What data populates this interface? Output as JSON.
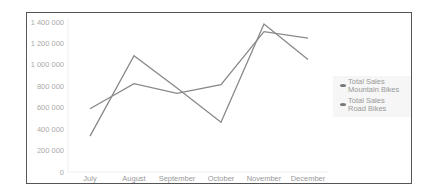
{
  "chart_data": {
    "type": "line",
    "title": "",
    "xlabel": "",
    "ylabel": "",
    "categories": [
      "July",
      "August",
      "September",
      "October",
      "November",
      "December"
    ],
    "series": [
      {
        "name": "Total Sales Mountain Bikes",
        "values": [
          335000,
          1085000,
          785000,
          465000,
          1380000,
          1050000
        ],
        "color": "#888888"
      },
      {
        "name": "Total Sales Road Bikes",
        "values": [
          590000,
          825000,
          735000,
          815000,
          1310000,
          1250000
        ],
        "color": "#888888"
      }
    ],
    "y_ticks": [
      "0",
      "200 000",
      "400 000",
      "600 000",
      "800 000",
      "1 000 000",
      "1 200 000",
      "1 400 000"
    ],
    "ylim": [
      0,
      1400000
    ],
    "grid": false,
    "legend_position": "right"
  },
  "legend": {
    "items": [
      {
        "label": "Total Sales\nMountain Bikes"
      },
      {
        "label": "Total Sales\nRoad Bikes"
      }
    ]
  }
}
